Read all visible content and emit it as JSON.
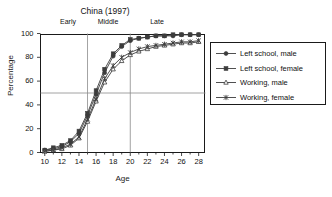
{
  "chart_data": {
    "type": "line",
    "title": "China (1997)",
    "xlabel": "Age",
    "ylabel": "Percentage",
    "xlim": [
      9.5,
      28.8
    ],
    "ylim": [
      0,
      100
    ],
    "xticks": [
      10,
      12,
      14,
      16,
      18,
      20,
      22,
      24,
      26,
      28
    ],
    "yticks": [
      0,
      20,
      40,
      60,
      80,
      100
    ],
    "grid": false,
    "legend_position": "right-outside",
    "reference_lines": [
      {
        "orientation": "horizontal",
        "value": 50
      },
      {
        "orientation": "vertical",
        "value": 15
      },
      {
        "orientation": "vertical",
        "value": 20
      }
    ],
    "annotations": [
      {
        "text": "Early",
        "x": 12.5
      },
      {
        "text": "Middle",
        "x": 17.0
      },
      {
        "text": "Late",
        "x": 23.0
      }
    ],
    "x": [
      10,
      11,
      12,
      13,
      14,
      15,
      16,
      17,
      18,
      19,
      20,
      21,
      22,
      23,
      24,
      25,
      26,
      27,
      28
    ],
    "series": [
      {
        "name": "Left school, male",
        "marker": "filled-circle",
        "values": [
          2,
          3,
          5,
          9,
          16,
          31,
          49,
          67,
          81,
          89,
          94,
          96,
          97,
          98,
          98,
          98,
          99,
          99,
          99
        ]
      },
      {
        "name": "Left school, female",
        "marker": "filled-square",
        "values": [
          2,
          4,
          6,
          10,
          18,
          33,
          52,
          70,
          83,
          90,
          95,
          96,
          97,
          98,
          98,
          99,
          99,
          99,
          99
        ]
      },
      {
        "name": "Working, male",
        "marker": "open-triangle",
        "values": [
          1,
          2,
          3,
          6,
          12,
          26,
          43,
          59,
          70,
          77,
          82,
          85,
          87,
          89,
          90,
          91,
          92,
          92,
          93
        ]
      },
      {
        "name": "Working, female",
        "marker": "cross-star",
        "values": [
          1,
          2,
          4,
          7,
          13,
          28,
          45,
          62,
          73,
          80,
          84,
          87,
          89,
          90,
          91,
          92,
          93,
          93,
          94
        ]
      }
    ]
  },
  "legend": {
    "items": [
      {
        "label": "Left school, male"
      },
      {
        "label": "Left school, female"
      },
      {
        "label": "Working, male"
      },
      {
        "label": "Working, female"
      }
    ]
  },
  "colors": {
    "axis": "#1a1a1a",
    "series": "#3c3c3c",
    "reference": "#8a8a8a",
    "background": "#ffffff"
  }
}
